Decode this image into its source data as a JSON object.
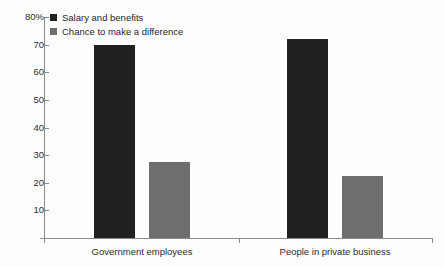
{
  "chart_data": {
    "type": "bar",
    "title": "",
    "subtitle": "",
    "xlabel": "",
    "ylabel": "",
    "categories": [
      "Government employees",
      "People in private business"
    ],
    "series": [
      {
        "name": "Salary and benefits",
        "color": "#212121",
        "values": [
          70,
          72
        ]
      },
      {
        "name": "Chance to make a difference",
        "color": "#6e6e6e",
        "values": [
          27.5,
          22.5
        ]
      }
    ],
    "ylim": [
      0,
      80
    ],
    "yticks": [
      0,
      10,
      20,
      30,
      40,
      50,
      60,
      70,
      80
    ],
    "ytick_labels": [
      "",
      "10",
      "20",
      "30",
      "40",
      "50",
      "60",
      "70",
      "80%"
    ],
    "grid": false,
    "legend_position": "top-left",
    "axis_color": "#8a8a8a"
  },
  "legend": {
    "items": [
      {
        "label": "Salary and benefits",
        "color": "#212121"
      },
      {
        "label": "Chance to make a difference",
        "color": "#6e6e6e"
      }
    ]
  },
  "y_axis": {
    "labels": [
      "80%",
      "70",
      "60",
      "50",
      "40",
      "30",
      "20",
      "10"
    ]
  },
  "x_axis": {
    "labels": [
      "Government employees",
      "People in private business"
    ]
  }
}
